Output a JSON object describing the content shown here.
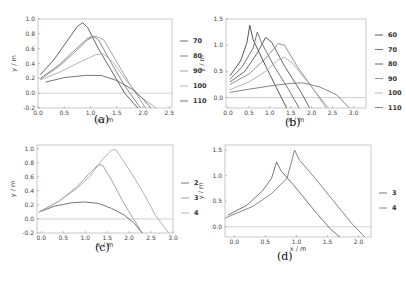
{
  "chart_data": [
    {
      "id": "a",
      "type": "line",
      "caption": "(a)",
      "xlabel": "x / m",
      "ylabel": "y / m",
      "xlim": [
        0.0,
        2.55
      ],
      "ylim": [
        -0.2,
        1.0
      ],
      "xticks": [
        "0.0",
        "0.5",
        "1.0",
        "1.5",
        "2.0",
        "2.5"
      ],
      "xtick_values": [
        0.0,
        0.5,
        1.0,
        1.5,
        2.0,
        2.5
      ],
      "yticks": [
        "-0.2",
        "0.0",
        "0.2",
        "0.4",
        "0.6",
        "0.8",
        "1.0"
      ],
      "ytick_values": [
        -0.2,
        0.0,
        0.2,
        0.4,
        0.6,
        0.8,
        1.0
      ],
      "hline": 0.0,
      "legend": [
        "70",
        "80",
        "90",
        "100",
        "110"
      ],
      "frame": {
        "left": 38,
        "top": 19,
        "right": 172,
        "bottom": 108
      },
      "legend_pos": {
        "x": 180,
        "y0": 41,
        "dy": 15
      },
      "caption_pos": {
        "x": 94,
        "y": 122
      },
      "series": [
        {
          "name": "70",
          "color": "#555555",
          "points": [
            [
              0.05,
              0.25
            ],
            [
              0.3,
              0.45
            ],
            [
              0.55,
              0.7
            ],
            [
              0.75,
              0.9
            ],
            [
              0.85,
              0.95
            ],
            [
              0.95,
              0.88
            ],
            [
              1.15,
              0.6
            ],
            [
              1.4,
              0.3
            ],
            [
              1.65,
              0.0
            ],
            [
              1.9,
              -0.2
            ]
          ]
        },
        {
          "name": "80",
          "color": "#777777",
          "points": [
            [
              0.05,
              0.2
            ],
            [
              0.4,
              0.38
            ],
            [
              0.7,
              0.58
            ],
            [
              0.95,
              0.74
            ],
            [
              1.05,
              0.77
            ],
            [
              1.15,
              0.72
            ],
            [
              1.4,
              0.4
            ],
            [
              1.65,
              0.1
            ],
            [
              1.95,
              -0.2
            ]
          ]
        },
        {
          "name": "90",
          "color": "#999999",
          "points": [
            [
              0.05,
              0.19
            ],
            [
              0.4,
              0.36
            ],
            [
              0.7,
              0.55
            ],
            [
              0.95,
              0.72
            ],
            [
              1.1,
              0.77
            ],
            [
              1.25,
              0.72
            ],
            [
              1.5,
              0.42
            ],
            [
              1.75,
              0.12
            ],
            [
              2.05,
              -0.2
            ]
          ]
        },
        {
          "name": "100",
          "color": "#aaaaaa",
          "points": [
            [
              0.05,
              0.18
            ],
            [
              0.4,
              0.28
            ],
            [
              0.8,
              0.42
            ],
            [
              1.1,
              0.52
            ],
            [
              1.25,
              0.53
            ],
            [
              1.45,
              0.4
            ],
            [
              1.7,
              0.15
            ],
            [
              1.95,
              -0.05
            ],
            [
              2.25,
              -0.2
            ]
          ]
        },
        {
          "name": "110",
          "color": "#666666",
          "points": [
            [
              0.15,
              0.15
            ],
            [
              0.5,
              0.21
            ],
            [
              0.9,
              0.24
            ],
            [
              1.2,
              0.24
            ],
            [
              1.5,
              0.17
            ],
            [
              1.8,
              0.05
            ],
            [
              2.0,
              -0.08
            ],
            [
              2.15,
              -0.2
            ]
          ]
        }
      ]
    },
    {
      "id": "b",
      "type": "line",
      "caption": "(b)",
      "xlabel": "x / m",
      "ylabel": "y / m",
      "xlim": [
        -0.05,
        3.3
      ],
      "ylim": [
        -0.2,
        1.5
      ],
      "xticks": [
        "0.0",
        "0.5",
        "1.0",
        "1.5",
        "2.0",
        "2.5",
        "3.0"
      ],
      "xtick_values": [
        0.0,
        0.5,
        1.0,
        1.5,
        2.0,
        2.5,
        3.0
      ],
      "yticks": [
        "0.0",
        "0.5",
        "1.0",
        "1.5"
      ],
      "ytick_values": [
        0.0,
        0.5,
        1.0,
        1.5
      ],
      "hline": 0.0,
      "legend": [
        "60",
        "70",
        "80",
        "90",
        "100",
        "110"
      ],
      "frame": {
        "left": 226,
        "top": 19,
        "right": 366,
        "bottom": 108
      },
      "legend_pos": {
        "x": 375,
        "y0": 35,
        "dy": 14.5
      },
      "caption_pos": {
        "x": 285,
        "y": 125
      },
      "series": [
        {
          "name": "60",
          "color": "#444444",
          "points": [
            [
              0.05,
              0.42
            ],
            [
              0.3,
              0.7
            ],
            [
              0.45,
              1.05
            ],
            [
              0.52,
              1.38
            ],
            [
              0.6,
              1.1
            ],
            [
              0.9,
              0.6
            ],
            [
              1.15,
              0.2
            ],
            [
              1.4,
              -0.2
            ]
          ]
        },
        {
          "name": "70",
          "color": "#666666",
          "points": [
            [
              0.05,
              0.35
            ],
            [
              0.35,
              0.6
            ],
            [
              0.6,
              0.95
            ],
            [
              0.7,
              1.25
            ],
            [
              0.8,
              1.05
            ],
            [
              1.1,
              0.6
            ],
            [
              1.45,
              0.15
            ],
            [
              1.7,
              -0.2
            ]
          ]
        },
        {
          "name": "80",
          "color": "#555555",
          "points": [
            [
              0.05,
              0.3
            ],
            [
              0.4,
              0.5
            ],
            [
              0.7,
              0.85
            ],
            [
              0.9,
              1.15
            ],
            [
              1.05,
              1.05
            ],
            [
              1.35,
              0.6
            ],
            [
              1.75,
              0.1
            ],
            [
              1.95,
              -0.2
            ]
          ]
        },
        {
          "name": "90",
          "color": "#888888",
          "points": [
            [
              0.05,
              0.25
            ],
            [
              0.5,
              0.45
            ],
            [
              0.9,
              0.75
            ],
            [
              1.2,
              1.03
            ],
            [
              1.35,
              1.0
            ],
            [
              1.65,
              0.6
            ],
            [
              2.05,
              0.15
            ],
            [
              2.35,
              -0.2
            ]
          ]
        },
        {
          "name": "100",
          "color": "#aaaaaa",
          "points": [
            [
              0.05,
              0.15
            ],
            [
              0.5,
              0.3
            ],
            [
              0.9,
              0.5
            ],
            [
              1.2,
              0.72
            ],
            [
              1.35,
              0.77
            ],
            [
              1.55,
              0.65
            ],
            [
              1.9,
              0.3
            ],
            [
              2.2,
              0.0
            ],
            [
              2.4,
              -0.2
            ]
          ]
        },
        {
          "name": "110",
          "color": "#777777",
          "points": [
            [
              0.05,
              0.1
            ],
            [
              0.5,
              0.16
            ],
            [
              1.0,
              0.22
            ],
            [
              1.5,
              0.27
            ],
            [
              1.8,
              0.28
            ],
            [
              2.2,
              0.2
            ],
            [
              2.6,
              0.05
            ],
            [
              2.9,
              -0.2
            ]
          ]
        }
      ]
    },
    {
      "id": "c",
      "type": "line",
      "caption": "(c)",
      "xlabel": "x / m",
      "ylabel": "y / m",
      "xlim": [
        -0.1,
        3.0
      ],
      "ylim": [
        -0.2,
        1.05
      ],
      "xticks": [
        "0.0",
        "0.5",
        "1.0",
        "1.5",
        "2.0",
        "2.5",
        "3.0"
      ],
      "xtick_values": [
        0.0,
        0.5,
        1.0,
        1.5,
        2.0,
        2.5,
        3.0
      ],
      "yticks": [
        "-0.2",
        "0.0",
        "0.2",
        "0.4",
        "0.6",
        "0.8",
        "1.0"
      ],
      "ytick_values": [
        -0.2,
        0.0,
        0.2,
        0.4,
        0.6,
        0.8,
        1.0
      ],
      "hline": 0.0,
      "legend": [
        "2",
        "3",
        "4"
      ],
      "frame": {
        "left": 37,
        "top": 145,
        "right": 173,
        "bottom": 233
      },
      "legend_pos": {
        "x": 181,
        "y0": 183,
        "dy": 15
      },
      "caption_pos": {
        "x": 95,
        "y": 250
      },
      "series": [
        {
          "name": "2",
          "color": "#666666",
          "points": [
            [
              -0.05,
              0.1
            ],
            [
              0.3,
              0.18
            ],
            [
              0.7,
              0.23
            ],
            [
              1.0,
              0.24
            ],
            [
              1.3,
              0.22
            ],
            [
              1.6,
              0.15
            ],
            [
              1.9,
              0.05
            ],
            [
              2.1,
              -0.05
            ],
            [
              2.3,
              -0.2
            ]
          ]
        },
        {
          "name": "3",
          "color": "#999999",
          "points": [
            [
              -0.05,
              0.1
            ],
            [
              0.4,
              0.25
            ],
            [
              0.8,
              0.45
            ],
            [
              1.1,
              0.65
            ],
            [
              1.3,
              0.77
            ],
            [
              1.4,
              0.76
            ],
            [
              1.6,
              0.55
            ],
            [
              1.9,
              0.2
            ],
            [
              2.1,
              0.0
            ],
            [
              2.3,
              -0.2
            ]
          ]
        },
        {
          "name": "4",
          "color": "#aaaaaa",
          "points": [
            [
              -0.05,
              0.1
            ],
            [
              0.4,
              0.25
            ],
            [
              0.8,
              0.43
            ],
            [
              1.1,
              0.6
            ],
            [
              1.4,
              0.85
            ],
            [
              1.6,
              0.98
            ],
            [
              1.7,
              0.98
            ],
            [
              1.9,
              0.8
            ],
            [
              2.3,
              0.4
            ],
            [
              2.6,
              0.05
            ],
            [
              2.9,
              -0.2
            ]
          ]
        }
      ]
    },
    {
      "id": "d",
      "type": "line",
      "caption": "(d)",
      "xlabel": "x / m",
      "ylabel": "y / m",
      "xlim": [
        -0.15,
        2.2
      ],
      "ylim": [
        -0.2,
        1.6
      ],
      "xticks": [
        "0.0",
        "0.5",
        "1.0",
        "1.5",
        "2.0"
      ],
      "xtick_values": [
        0.0,
        0.5,
        1.0,
        1.5,
        2.0
      ],
      "yticks": [
        "0.0",
        "0.5",
        "1.0",
        "1.5"
      ],
      "ytick_values": [
        0.0,
        0.5,
        1.0,
        1.5
      ],
      "hline": 0.0,
      "legend": [
        "3",
        "4"
      ],
      "frame": {
        "left": 225,
        "top": 145,
        "right": 371,
        "bottom": 237
      },
      "legend_pos": {
        "x": 379,
        "y0": 193,
        "dy": 15
      },
      "caption_pos": {
        "x": 277,
        "y": 259
      },
      "series": [
        {
          "name": "3",
          "color": "#666666",
          "points": [
            [
              -0.1,
              0.23
            ],
            [
              0.2,
              0.42
            ],
            [
              0.45,
              0.7
            ],
            [
              0.6,
              0.95
            ],
            [
              0.68,
              1.27
            ],
            [
              0.75,
              1.1
            ],
            [
              1.0,
              0.75
            ],
            [
              1.3,
              0.3
            ],
            [
              1.55,
              -0.05
            ],
            [
              1.7,
              -0.2
            ]
          ]
        },
        {
          "name": "4",
          "color": "#777777",
          "points": [
            [
              -0.15,
              0.17
            ],
            [
              0.3,
              0.4
            ],
            [
              0.6,
              0.65
            ],
            [
              0.85,
              0.95
            ],
            [
              0.97,
              1.5
            ],
            [
              1.05,
              1.3
            ],
            [
              1.3,
              0.95
            ],
            [
              1.6,
              0.5
            ],
            [
              1.9,
              0.05
            ],
            [
              2.1,
              -0.2
            ]
          ]
        }
      ]
    }
  ]
}
